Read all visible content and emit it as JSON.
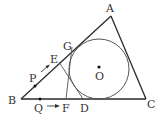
{
  "diagram": {
    "type": "geometry",
    "points": {
      "A": {
        "label": "A",
        "x": 111,
        "y": 16
      },
      "B": {
        "label": "B",
        "x": 21,
        "y": 99
      },
      "C": {
        "label": "C",
        "x": 146,
        "y": 99
      },
      "O": {
        "label": "O",
        "x": 99,
        "y": 69
      },
      "G": {
        "label": "G",
        "x": 72,
        "y": 47
      },
      "E": {
        "label": "E",
        "x": 59,
        "y": 62
      },
      "P": {
        "label": "P",
        "x": 35,
        "y": 86
      },
      "Q": {
        "label": "Q",
        "x": 40,
        "y": 99
      },
      "F": {
        "label": "F",
        "x": 66,
        "y": 99
      },
      "D": {
        "label": "D",
        "x": 83,
        "y": 99
      }
    },
    "circle": {
      "center": "O",
      "radius": 30
    },
    "segments": [
      [
        "A",
        "B"
      ],
      [
        "B",
        "C"
      ],
      [
        "C",
        "A"
      ],
      [
        "G",
        "F"
      ],
      [
        "E",
        "D"
      ]
    ],
    "arrows": [
      {
        "name": "P-to-E-motion",
        "from": "P",
        "to": "E",
        "along": "AB"
      },
      {
        "name": "Q-to-F-motion",
        "from": "Q",
        "to": "F",
        "along": "BC"
      }
    ],
    "colors": {
      "stroke": "#2a2a2a",
      "circle": "#555555",
      "label": "#333333"
    }
  }
}
